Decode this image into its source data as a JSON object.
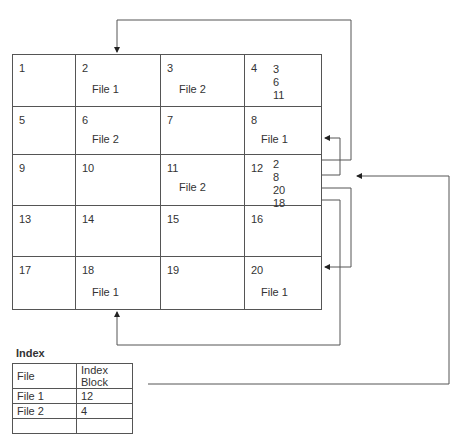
{
  "diagram": {
    "type": "indexed-allocation",
    "blocks": [
      {
        "id": "1",
        "label": ""
      },
      {
        "id": "2",
        "label": "File 1"
      },
      {
        "id": "3",
        "label": "File 2"
      },
      {
        "id": "4",
        "label": "",
        "pointers": [
          "3",
          "6",
          "11"
        ]
      },
      {
        "id": "5",
        "label": ""
      },
      {
        "id": "6",
        "label": "File 2"
      },
      {
        "id": "7",
        "label": ""
      },
      {
        "id": "8",
        "label": "File 1"
      },
      {
        "id": "9",
        "label": ""
      },
      {
        "id": "10",
        "label": ""
      },
      {
        "id": "11",
        "label": "File 2"
      },
      {
        "id": "12",
        "label": "",
        "pointers": [
          "2",
          "8",
          "20",
          "18"
        ]
      },
      {
        "id": "13",
        "label": ""
      },
      {
        "id": "14",
        "label": ""
      },
      {
        "id": "15",
        "label": ""
      },
      {
        "id": "16",
        "label": ""
      },
      {
        "id": "17",
        "label": ""
      },
      {
        "id": "18",
        "label": "File 1"
      },
      {
        "id": "19",
        "label": ""
      },
      {
        "id": "20",
        "label": "File 1"
      }
    ],
    "arrows": [
      {
        "from": "12",
        "to": "2"
      },
      {
        "from": "12",
        "to": "8"
      },
      {
        "from": "12",
        "to": "20"
      },
      {
        "from": "12",
        "to": "18"
      },
      {
        "from": "index.File 1",
        "to": "12"
      }
    ]
  },
  "index": {
    "title": "Index",
    "headers": [
      "File",
      "Index Block"
    ],
    "rows": [
      [
        "File 1",
        "12"
      ],
      [
        "File 2",
        "4"
      ],
      [
        "",
        ""
      ]
    ]
  }
}
